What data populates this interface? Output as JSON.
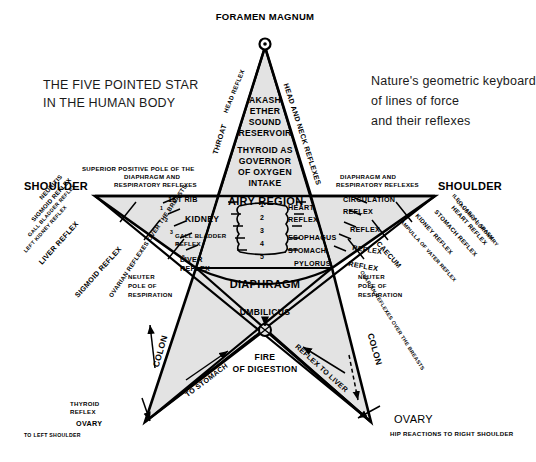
{
  "page": {
    "title_left": [
      "THE FIVE POINTED STAR",
      "IN THE HUMAN BODY"
    ],
    "caption_right": [
      "Nature's geometric keyboard",
      "of lines of force",
      "and their reflexes"
    ],
    "background_color": "#ffffff",
    "star_fill": "#e3e3e3",
    "ink_color": "#000000"
  },
  "labels": {
    "apex": "FORAMEN MAGNUM",
    "apex_left_arc": "HEAD REFLEX",
    "apex_left_down": "THROAT",
    "apex_right_arc": "HEAD AND NECK REFLEXES",
    "crown_block": [
      "AKASH",
      "ETHER",
      "SOUND",
      "RESERVOIR"
    ],
    "thyroid_block": [
      "THYROID AS",
      "GOVERNOR",
      "OF OXYGEN",
      "INTAKE"
    ],
    "shoulder_left": "SHOULDER",
    "shoulder_right": "SHOULDER",
    "superior_pole_left": [
      "SUPERIOR POSITIVE POLE OF THE",
      "DIAPHRAGM AND",
      "RESPIRATORY REFLEXES"
    ],
    "superior_pole_right": [
      "DIAPHRAGM AND",
      "RESPIRATORY REFLEXES"
    ],
    "first_rib": "1ST RIB",
    "airy_region": "AIRY REGION",
    "kidney": "KIDNEY",
    "gall_bladder_reflex": [
      "GALL BLADDER",
      "REFLEX"
    ],
    "liver_reflex": [
      "LIVER",
      "REFLEX"
    ],
    "heart_reflex": [
      "HEART",
      "REFLEX"
    ],
    "esophagus": "ESOPHAGUS",
    "stomach": "STOMACH",
    "pylorus": "PYLORUS",
    "circulation_reflex": [
      "CIRCULATION",
      "REFLEX"
    ],
    "right_reflex_1": "REFLEX",
    "right_reflex_2": "REFLEX",
    "right_reflex_3": "REFLEX",
    "diaphragm": "DIAPHRAGM",
    "umbilicus": "UMBILICUS",
    "neuter_pole_left": [
      "NEUTER",
      "POLE OF",
      "RESPIRATION"
    ],
    "neuter_pole_right": [
      "NEUTER",
      "POLE OF",
      "RESPIRATION"
    ],
    "fire_of_digestion": [
      "FIRE",
      "OF DIGESTION"
    ],
    "to_stomach": "TO STOMACH",
    "reflex_to_liver": "REFLEX TO LIVER",
    "colon_left": "COLON",
    "colon_right": "COLON",
    "ovary_left": "OVARY",
    "ovary_right": "OVARY",
    "thyroid_reflex": [
      "THYROID",
      "REFLEX"
    ],
    "to_left_shoulder": "TO LEFT SHOULDER",
    "hip_reactions": "HIP REACTIONS TO RIGHT SHOULDER",
    "left_arm_reflexes": [
      "NEURITIS",
      "SIGMOID REFLEX",
      "GALL BLADDER REFLEX",
      "LEFT KIDNEY REFLEX",
      "LIVER REFLEX",
      "SIGMOID REFLEX",
      "OVARIAN REFLEXES OVER THE BREASTS"
    ],
    "right_arm_reflexes": [
      "ILEO CAECAL SPASM",
      "CAUSING CORONARY",
      "HEART REFLEX",
      "STOMACH REFLEX",
      "KIDNEY REFLEX",
      "AMPULLA OF VATER REFLEX",
      "CAECUM",
      "OVARIAN REFLEXES OVER THE BREASTS"
    ],
    "center_numbers": [
      "1",
      "2",
      "3",
      "4",
      "5"
    ],
    "rib_numbers_left": [
      "1",
      "2",
      "3",
      "4",
      "5"
    ]
  }
}
